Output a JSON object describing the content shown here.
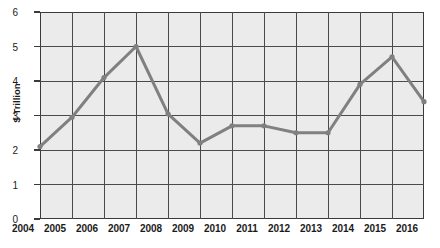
{
  "chart_data": {
    "type": "line",
    "title": "",
    "xlabel": "",
    "ylabel": "$ Trillion",
    "categories": [
      "2004",
      "2005",
      "2006",
      "2007",
      "2008",
      "2009",
      "2010",
      "2011",
      "2012",
      "2013",
      "2014",
      "2015",
      "2016"
    ],
    "values": [
      2.1,
      2.95,
      4.1,
      5.0,
      3.05,
      2.2,
      2.7,
      2.7,
      2.5,
      2.5,
      3.9,
      4.7,
      3.4
    ],
    "series": [
      {
        "name": "$ Trillion",
        "values": [
          2.1,
          2.95,
          4.1,
          5.0,
          3.05,
          2.2,
          2.7,
          2.7,
          2.5,
          2.5,
          3.9,
          4.7,
          3.4
        ]
      }
    ],
    "ylim": [
      0,
      6
    ],
    "y_ticks": [
      0,
      1,
      2,
      3,
      4,
      5,
      6
    ],
    "y_tick_labels": [
      "0",
      "1",
      "2",
      "3",
      "4",
      "5",
      "6"
    ],
    "x_ticks": [
      "2004",
      "2005",
      "2006",
      "2007",
      "2008",
      "2009",
      "2010",
      "2011",
      "2012",
      "2013",
      "2014",
      "2015",
      "2016"
    ],
    "grid": true,
    "grid_axes": "both",
    "legend": false,
    "legend_position": "none",
    "markers": true,
    "line_color": "#808080",
    "marker_color": "#808080",
    "plot_background": "#ebebeb",
    "axis_color": "#3a3a3a",
    "gridline_color": "#4a4a4a",
    "text_color": "#1b1b1b"
  }
}
